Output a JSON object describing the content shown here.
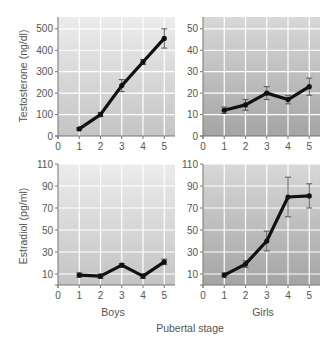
{
  "chart_data": [
    {
      "type": "line",
      "panel": "top-left",
      "title": "",
      "xlabel": "",
      "ylabel": "Testosterone (ng/dl)",
      "x": [
        1,
        2,
        3,
        4,
        5
      ],
      "x_ticks": [
        0,
        1,
        2,
        3,
        4,
        5
      ],
      "y_ticks": [
        0,
        100,
        200,
        300,
        400,
        500
      ],
      "ylim": [
        0,
        555
      ],
      "xlim": [
        0,
        5.3
      ],
      "grid": true,
      "series": [
        {
          "name": "Boys testosterone",
          "values": [
            33,
            100,
            235,
            345,
            455
          ],
          "error": [
            5,
            10,
            28,
            12,
            45
          ]
        }
      ]
    },
    {
      "type": "line",
      "panel": "top-right",
      "title": "",
      "xlabel": "",
      "ylabel": "",
      "x": [
        1,
        2,
        3,
        4,
        5
      ],
      "x_ticks": [
        0,
        1,
        2,
        3,
        4,
        5
      ],
      "y_ticks": [
        0,
        10,
        20,
        30,
        40,
        50
      ],
      "ylim": [
        0,
        55.5
      ],
      "xlim": [
        0,
        5.5
      ],
      "grid": true,
      "series": [
        {
          "name": "Girls testosterone",
          "values": [
            12,
            14.5,
            20,
            17,
            23
          ],
          "error": [
            1.5,
            2.5,
            3,
            2,
            4
          ]
        }
      ]
    },
    {
      "type": "line",
      "panel": "bottom-left",
      "title": "",
      "xlabel": "Boys",
      "ylabel": "Estradiol (pg/ml)",
      "x": [
        1,
        2,
        3,
        4,
        5
      ],
      "x_ticks": [
        0,
        1,
        2,
        3,
        4,
        5
      ],
      "y_ticks": [
        10,
        30,
        50,
        70,
        90,
        110
      ],
      "ylim": [
        0,
        110
      ],
      "xlim": [
        0,
        5.3
      ],
      "grid": true,
      "series": [
        {
          "name": "Boys estradiol",
          "values": [
            9,
            8,
            18,
            8,
            21
          ],
          "error": [
            2,
            2,
            1.5,
            2,
            2.5
          ]
        }
      ]
    },
    {
      "type": "line",
      "panel": "bottom-right",
      "title": "",
      "xlabel": "Girls",
      "ylabel": "",
      "x": [
        1,
        2,
        3,
        4,
        5
      ],
      "x_ticks": [
        0,
        1,
        2,
        3,
        4,
        5
      ],
      "y_ticks": [
        10,
        30,
        50,
        70,
        90,
        110
      ],
      "ylim": [
        0,
        110
      ],
      "xlim": [
        0,
        5.5
      ],
      "grid": true,
      "series": [
        {
          "name": "Girls estradiol",
          "values": [
            9,
            19,
            40,
            80,
            81
          ],
          "error": [
            2,
            3,
            9,
            18,
            11
          ]
        }
      ]
    }
  ],
  "labels": {
    "testosterone_axis": "Testosterone (ng/dl)",
    "estradiol_axis": "Estradiol (pg/ml)",
    "boys": "Boys",
    "girls": "Girls",
    "shared_xlabel": "Pubertal stage"
  },
  "colors": {
    "line": "#111111",
    "grid": "#ffffff",
    "left_panel_top": "#ececec",
    "left_panel_bottom": "#c4c4c4",
    "right_panel_top": "#d8d8d8",
    "right_panel_bottom": "#a4a4a4",
    "axis": "#777777",
    "error_bar": "#555555"
  }
}
